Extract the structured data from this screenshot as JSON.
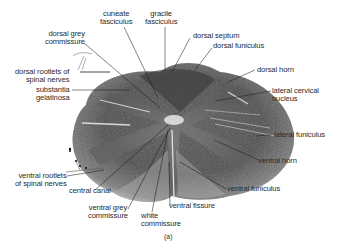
{
  "figure": {
    "caption": "(a)",
    "footer_faint": "· · ·"
  },
  "labels": {
    "cuneate_fasciculus": "cuneate\nfasciculus",
    "gracile_fasciculus": "gracile\nfasciculus",
    "dorsal_grey_commissure": "dorsal grey\ncommissure",
    "dorsal_septum": "dorsal septum",
    "dorsal_funiculus": "dorsal funiculus",
    "dorsal_rootlets": "dorsal rootlets of\nspinal nerves",
    "dorsal_horn": "dorsal horn",
    "substantia_gelatinosa": "substantia\ngelatinosa",
    "lateral_cervical_nucleus": "lateral cervical\nnucleus",
    "lateral_funiculus": "lateral funiculus",
    "ventral_horn": "ventral horn",
    "ventral_rootlets": "ventral rootlets\nof spinal nerves",
    "central_canal": "central canal",
    "ventral_funiculus": "ventral funiculus",
    "ventral_grey_commissure": "ventral grey\ncommissure",
    "ventral_fissure": "ventral fissure",
    "white_commissure": "white\ncommissure"
  },
  "colors": {
    "ink": "#2a2a2a",
    "tissue_dark": "#3a3a3a",
    "tissue_mid": "#6e6e6e",
    "tissue_light": "#c9c9c9",
    "background": "#ffffff"
  }
}
